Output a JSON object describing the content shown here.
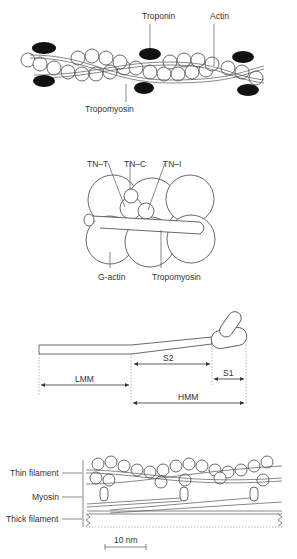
{
  "panel_a": {
    "labels": {
      "troponin": "Troponin",
      "actin": "Actin",
      "tropomyosin": "Tropomyosin"
    }
  },
  "panel_b": {
    "labels": {
      "tnt": "TN–T",
      "tnc": "TN–C",
      "tni": "TN–I",
      "gactin": "G-actin",
      "tropomyosin": "Tropomyosin"
    }
  },
  "panel_c": {
    "labels": {
      "s2": "S2",
      "s1": "S1",
      "lmm": "LMM",
      "hmm": "HMM"
    }
  },
  "panel_d": {
    "labels": {
      "thin": "Thin filament",
      "myosin": "Myosin",
      "thick": "Thick filament"
    },
    "scale_bar": "10 nm"
  }
}
